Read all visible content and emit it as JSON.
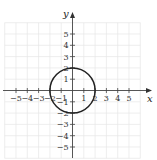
{
  "chart_data": {
    "type": "line",
    "title": "",
    "xlabel": "x",
    "ylabel": "y",
    "xlim": [
      -6,
      6
    ],
    "ylim": [
      -6,
      6
    ],
    "grid": true,
    "x_ticks": [
      -5,
      -4,
      -3,
      -2,
      -1,
      1,
      2,
      3,
      4,
      5
    ],
    "y_ticks": [
      -5,
      -4,
      -3,
      -2,
      -1,
      1,
      2,
      3,
      4,
      5
    ],
    "x_tick_labels": [
      "−5",
      "−4",
      "−3",
      "−2",
      "−1",
      "1",
      "2",
      "3",
      "4",
      "5"
    ],
    "y_tick_labels": [
      "−5",
      "−4",
      "−3",
      "−2",
      "−1",
      "1",
      "2",
      "3",
      "4",
      "5"
    ],
    "series": [
      {
        "name": "circle",
        "shape": "circle",
        "center": [
          0,
          0
        ],
        "radius": 2,
        "equation": "x^2 + y^2 = 4"
      }
    ],
    "colors": {
      "curve": "#222222",
      "axis": "#444444",
      "grid": "#e6e6e6"
    }
  }
}
